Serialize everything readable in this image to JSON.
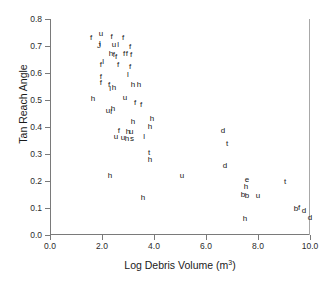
{
  "chart_data": {
    "type": "scatter",
    "title": "",
    "xlabel": "Log Debris Volume (m3)",
    "xlabel_base": "Log Debris Volume (m",
    "xlabel_sup": "3",
    "xlabel_tail": ")",
    "ylabel": "Tan Reach Angle",
    "xlim": [
      0.0,
      10.0
    ],
    "ylim": [
      0.0,
      0.8
    ],
    "xticks": [
      "0.0",
      "2.0",
      "4.0",
      "6.0",
      "8.0",
      "10.0"
    ],
    "xtick_values": [
      0.0,
      2.0,
      4.0,
      6.0,
      8.0,
      10.0
    ],
    "yticks": [
      "0.0",
      "0.1",
      "0.2",
      "0.3",
      "0.4",
      "0.5",
      "0.6",
      "0.7",
      "0.8"
    ],
    "ytick_values": [
      0.0,
      0.1,
      0.2,
      0.3,
      0.4,
      0.5,
      0.6,
      0.7,
      0.8
    ],
    "grid": false,
    "legend": "none",
    "marker_style": "text-label",
    "marker_color": "#151515",
    "axis_color": "#7a7a7a",
    "background": "#ffffff",
    "point_label_categories": [
      "f",
      "u",
      "l",
      "h",
      "t",
      "d",
      "s",
      "e",
      "b"
    ],
    "points": [
      {
        "label": "f",
        "x": 1.58,
        "y": 0.731
      },
      {
        "label": "u",
        "x": 1.96,
        "y": 0.746
      },
      {
        "label": "f",
        "x": 2.37,
        "y": 0.735
      },
      {
        "label": "f",
        "x": 2.81,
        "y": 0.731
      },
      {
        "label": "l",
        "x": 1.92,
        "y": 0.707
      },
      {
        "label": "J",
        "x": 1.88,
        "y": 0.7
      },
      {
        "label": "u",
        "x": 2.46,
        "y": 0.705
      },
      {
        "label": "l",
        "x": 2.62,
        "y": 0.705
      },
      {
        "label": "f",
        "x": 3.08,
        "y": 0.697
      },
      {
        "label": "h",
        "x": 2.35,
        "y": 0.672
      },
      {
        "label": "f",
        "x": 2.46,
        "y": 0.665
      },
      {
        "label": "f",
        "x": 2.54,
        "y": 0.661
      },
      {
        "label": "f",
        "x": 2.85,
        "y": 0.672
      },
      {
        "label": "f",
        "x": 2.96,
        "y": 0.672
      },
      {
        "label": "f",
        "x": 3.12,
        "y": 0.665
      },
      {
        "label": "f",
        "x": 1.96,
        "y": 0.631
      },
      {
        "label": "l",
        "x": 2.04,
        "y": 0.639
      },
      {
        "label": "f",
        "x": 2.62,
        "y": 0.628
      },
      {
        "label": "f",
        "x": 3.08,
        "y": 0.624
      },
      {
        "label": "f",
        "x": 1.96,
        "y": 0.586
      },
      {
        "label": "l",
        "x": 3.0,
        "y": 0.592
      },
      {
        "label": "f",
        "x": 1.96,
        "y": 0.563
      },
      {
        "label": "f",
        "x": 2.27,
        "y": 0.556
      },
      {
        "label": "l",
        "x": 2.31,
        "y": 0.541
      },
      {
        "label": "h",
        "x": 2.46,
        "y": 0.545
      },
      {
        "label": "h",
        "x": 3.19,
        "y": 0.556
      },
      {
        "label": "h",
        "x": 3.42,
        "y": 0.556
      },
      {
        "label": "h",
        "x": 1.65,
        "y": 0.502
      },
      {
        "label": "u",
        "x": 2.88,
        "y": 0.507
      },
      {
        "label": "u",
        "x": 2.23,
        "y": 0.458
      },
      {
        "label": "h",
        "x": 2.42,
        "y": 0.468
      },
      {
        "label": "l",
        "x": 2.35,
        "y": 0.454
      },
      {
        "label": "f",
        "x": 3.27,
        "y": 0.488
      },
      {
        "label": "f",
        "x": 3.5,
        "y": 0.481
      },
      {
        "label": "h",
        "x": 3.19,
        "y": 0.42
      },
      {
        "label": "h",
        "x": 3.92,
        "y": 0.428
      },
      {
        "label": "h",
        "x": 3.85,
        "y": 0.401
      },
      {
        "label": "f",
        "x": 2.65,
        "y": 0.386
      },
      {
        "label": "h",
        "x": 3.0,
        "y": 0.382
      },
      {
        "label": "u",
        "x": 3.12,
        "y": 0.382
      },
      {
        "label": "u",
        "x": 2.54,
        "y": 0.363
      },
      {
        "label": "u",
        "x": 2.81,
        "y": 0.359
      },
      {
        "label": "h",
        "x": 2.96,
        "y": 0.355
      },
      {
        "label": "s",
        "x": 3.15,
        "y": 0.355
      },
      {
        "label": "l",
        "x": 3.62,
        "y": 0.363
      },
      {
        "label": "d",
        "x": 6.65,
        "y": 0.386
      },
      {
        "label": "t",
        "x": 6.81,
        "y": 0.336
      },
      {
        "label": "t",
        "x": 3.81,
        "y": 0.305
      },
      {
        "label": "h",
        "x": 3.85,
        "y": 0.278
      },
      {
        "label": "d",
        "x": 6.73,
        "y": 0.255
      },
      {
        "label": "h",
        "x": 2.31,
        "y": 0.22
      },
      {
        "label": "u",
        "x": 5.08,
        "y": 0.22
      },
      {
        "label": "e",
        "x": 7.58,
        "y": 0.205
      },
      {
        "label": "t",
        "x": 9.04,
        "y": 0.197
      },
      {
        "label": "h",
        "x": 7.54,
        "y": 0.178
      },
      {
        "label": "b",
        "x": 7.42,
        "y": 0.147
      },
      {
        "label": "b",
        "x": 7.58,
        "y": 0.143
      },
      {
        "label": "u",
        "x": 8.0,
        "y": 0.143
      },
      {
        "label": "h",
        "x": 3.58,
        "y": 0.136
      },
      {
        "label": "b",
        "x": 9.46,
        "y": 0.097
      },
      {
        "label": "f",
        "x": 9.58,
        "y": 0.101
      },
      {
        "label": "d",
        "x": 9.77,
        "y": 0.089
      },
      {
        "label": "d",
        "x": 10.0,
        "y": 0.063
      },
      {
        "label": "h",
        "x": 7.5,
        "y": 0.059
      }
    ]
  }
}
